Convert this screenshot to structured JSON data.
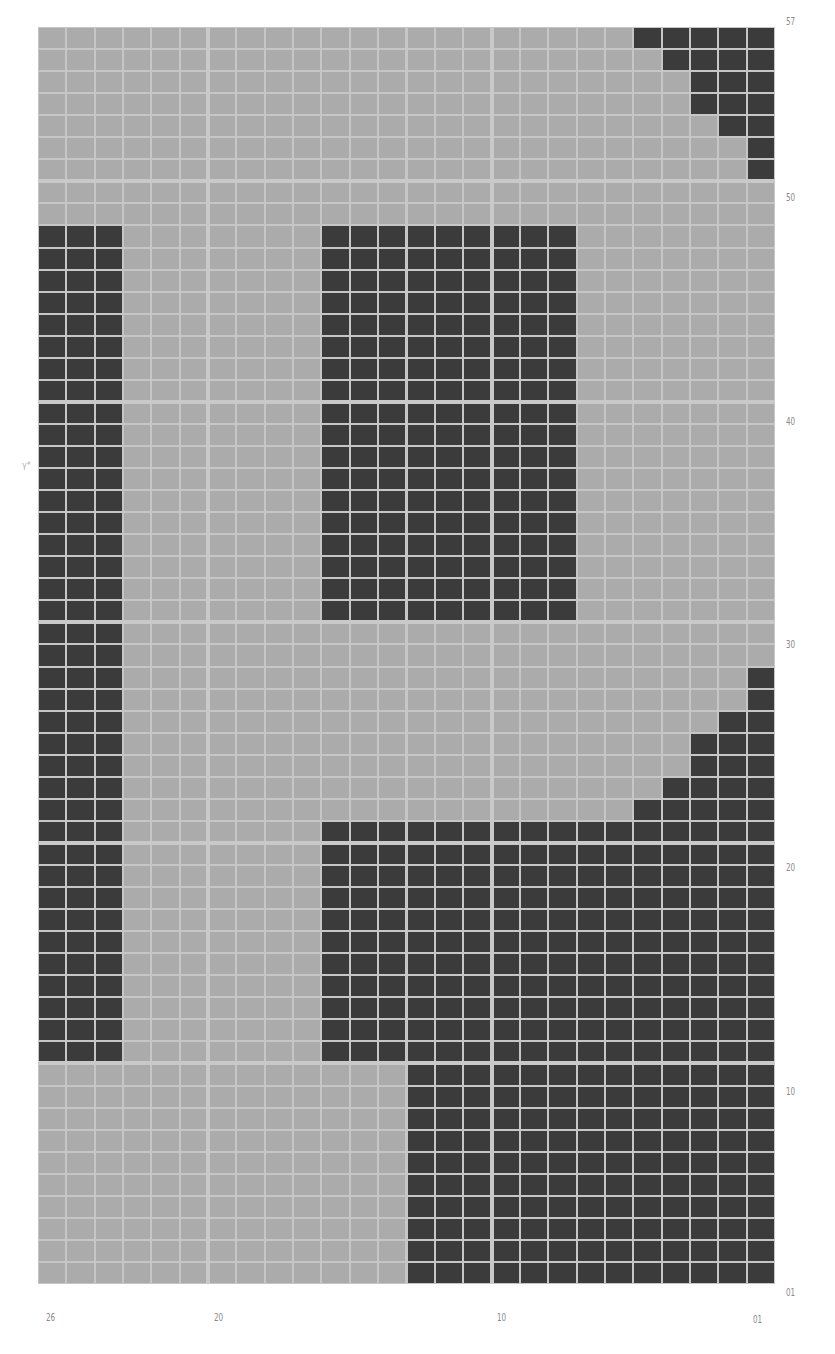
{
  "grid": {
    "columns": 26,
    "rows": 57,
    "column_order": "descending-left-to-right",
    "row_order": "descending-top-to-bottom",
    "colors": {
      "empty": "#ababab",
      "filled": "#3b3b3b",
      "gridline": "#c6c6c6",
      "divider": "#c9c9c9"
    },
    "major_every": 10,
    "filled_ranges": [
      {
        "rows": [
          57,
          57
        ],
        "cols": [
          1,
          5
        ]
      },
      {
        "rows": [
          56,
          56
        ],
        "cols": [
          1,
          4
        ]
      },
      {
        "rows": [
          54,
          55
        ],
        "cols": [
          1,
          3
        ]
      },
      {
        "rows": [
          53,
          53
        ],
        "cols": [
          1,
          2
        ]
      },
      {
        "rows": [
          51,
          52
        ],
        "cols": [
          1,
          1
        ]
      },
      {
        "rows": [
          11,
          48
        ],
        "cols": [
          24,
          26
        ]
      },
      {
        "rows": [
          31,
          48
        ],
        "cols": [
          8,
          16
        ]
      },
      {
        "rows": [
          27,
          28
        ],
        "cols": [
          1,
          1
        ]
      },
      {
        "rows": [
          26,
          26
        ],
        "cols": [
          1,
          2
        ]
      },
      {
        "rows": [
          24,
          25
        ],
        "cols": [
          1,
          3
        ]
      },
      {
        "rows": [
          23,
          23
        ],
        "cols": [
          1,
          4
        ]
      },
      {
        "rows": [
          22,
          22
        ],
        "cols": [
          1,
          5
        ]
      },
      {
        "rows": [
          11,
          21
        ],
        "cols": [
          1,
          16
        ]
      },
      {
        "rows": [
          1,
          10
        ],
        "cols": [
          1,
          13
        ]
      }
    ]
  },
  "axis": {
    "right_labels": [
      "57",
      "50",
      "40",
      "30",
      "20",
      "10",
      "01"
    ],
    "bottom_labels": [
      "26",
      "20",
      "10",
      "01"
    ],
    "left_mark": "γ*"
  }
}
